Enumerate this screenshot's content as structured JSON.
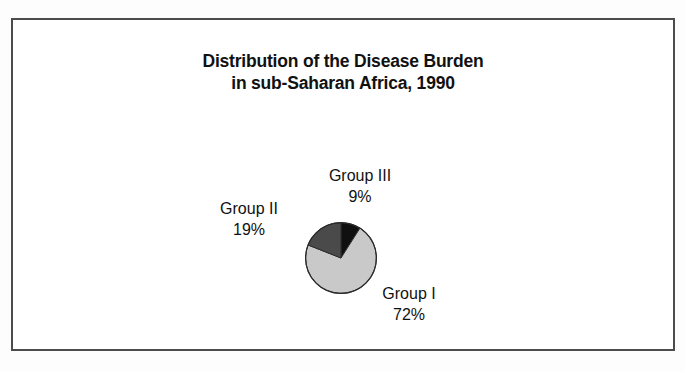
{
  "figure": {
    "title_line_1": "Distribution of the Disease Burden",
    "title_line_2": "in sub-Saharan Africa, 1990",
    "frame_color": "#4c4c4c",
    "background_color": "#ffffff"
  },
  "chart_data": {
    "type": "pie",
    "title": "Distribution of the Disease Burden in sub-Saharan Africa, 1990",
    "xlabel": "",
    "ylabel": "",
    "grid": false,
    "legend_position": "none",
    "labels_outside": true,
    "start_angle_deg": 0,
    "direction": "clockwise",
    "categories": [
      "Group III",
      "Group I",
      "Group II"
    ],
    "values": [
      9,
      72,
      19
    ],
    "units": "percent",
    "slices": [
      {
        "name": "Group III",
        "value": 9,
        "value_label": "9%",
        "color": "#101010",
        "start_deg": 0,
        "end_deg": 32.4,
        "label_position": "top"
      },
      {
        "name": "Group I",
        "value": 72,
        "value_label": "72%",
        "color": "#c9c9c9",
        "start_deg": 32.4,
        "end_deg": 291.6,
        "label_position": "bottom-right"
      },
      {
        "name": "Group II",
        "value": 19,
        "value_label": "19%",
        "color": "#4a4a4a",
        "start_deg": 291.6,
        "end_deg": 360,
        "label_position": "left"
      }
    ]
  }
}
